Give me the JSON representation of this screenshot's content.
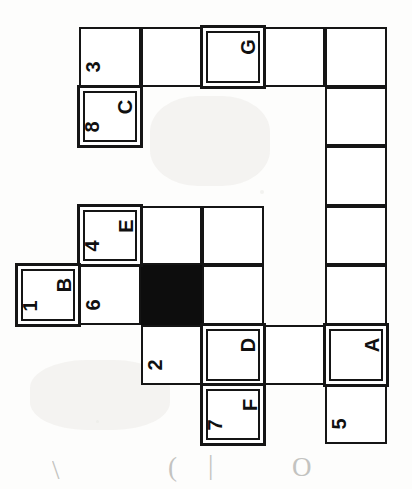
{
  "document": {
    "kind": "hand-drawn grid diagram",
    "orientation_note": "scan rotated 90 degrees; labels read sideways",
    "background_color": "#fdfdfc",
    "line_color": "#151515",
    "filled_cell_color": "#0d0d0d"
  },
  "grid": {
    "columns": 5,
    "rows": 7,
    "left": 79,
    "top": 27,
    "cell_width": 61.6,
    "cell_height": 59.6
  },
  "cells": [
    {
      "id": "c-r0-c0",
      "row": 0,
      "col": 0,
      "number": "3",
      "letter": "",
      "double_border": false,
      "filled": false
    },
    {
      "id": "c-r0-c1",
      "row": 0,
      "col": 1,
      "number": "",
      "letter": "",
      "double_border": false,
      "filled": false
    },
    {
      "id": "c-r0-c2",
      "row": 0,
      "col": 2,
      "number": "",
      "letter": "G",
      "double_border": true,
      "filled": false
    },
    {
      "id": "c-r0-c3",
      "row": 0,
      "col": 3,
      "number": "",
      "letter": "",
      "double_border": false,
      "filled": false
    },
    {
      "id": "c-r0-c4",
      "row": 0,
      "col": 4,
      "number": "",
      "letter": "",
      "double_border": false,
      "filled": false
    },
    {
      "id": "c-r1-c0",
      "row": 1,
      "col": 0,
      "number": "8",
      "letter": "C",
      "double_border": true,
      "filled": false
    },
    {
      "id": "c-r1-c4",
      "row": 1,
      "col": 4,
      "number": "",
      "letter": "",
      "double_border": false,
      "filled": false
    },
    {
      "id": "c-r2-c4",
      "row": 2,
      "col": 4,
      "number": "",
      "letter": "",
      "double_border": false,
      "filled": false
    },
    {
      "id": "c-r3-c0",
      "row": 3,
      "col": 0,
      "number": "4",
      "letter": "E",
      "double_border": true,
      "filled": false
    },
    {
      "id": "c-r3-c1",
      "row": 3,
      "col": 1,
      "number": "",
      "letter": "",
      "double_border": false,
      "filled": false
    },
    {
      "id": "c-r3-c2",
      "row": 3,
      "col": 2,
      "number": "",
      "letter": "",
      "double_border": false,
      "filled": false
    },
    {
      "id": "c-r3-c4",
      "row": 3,
      "col": 4,
      "number": "",
      "letter": "",
      "double_border": false,
      "filled": false
    },
    {
      "id": "c-r4-cL",
      "row": 4,
      "col": -1,
      "number": "1",
      "letter": "B",
      "double_border": true,
      "filled": false
    },
    {
      "id": "c-r4-c0",
      "row": 4,
      "col": 0,
      "number": "6",
      "letter": "",
      "double_border": false,
      "filled": false
    },
    {
      "id": "c-r4-c1",
      "row": 4,
      "col": 1,
      "number": "",
      "letter": "",
      "double_border": false,
      "filled": true
    },
    {
      "id": "c-r4-c2",
      "row": 4,
      "col": 2,
      "number": "",
      "letter": "",
      "double_border": false,
      "filled": false
    },
    {
      "id": "c-r4-c4",
      "row": 4,
      "col": 4,
      "number": "",
      "letter": "",
      "double_border": false,
      "filled": false
    },
    {
      "id": "c-r5-c1",
      "row": 5,
      "col": 1,
      "number": "2",
      "letter": "",
      "double_border": false,
      "filled": false
    },
    {
      "id": "c-r5-c2",
      "row": 5,
      "col": 2,
      "number": "",
      "letter": "D",
      "double_border": true,
      "filled": false
    },
    {
      "id": "c-r5-c3",
      "row": 5,
      "col": 3,
      "number": "",
      "letter": "",
      "double_border": false,
      "filled": false
    },
    {
      "id": "c-r5-c4",
      "row": 5,
      "col": 4,
      "number": "",
      "letter": "A",
      "double_border": true,
      "filled": false
    },
    {
      "id": "c-r6-c2",
      "row": 6,
      "col": 2,
      "number": "7",
      "letter": "F",
      "double_border": true,
      "filled": false
    },
    {
      "id": "c-r6-c4",
      "row": 6,
      "col": 4,
      "number": "5",
      "letter": "",
      "double_border": false,
      "filled": false
    }
  ],
  "annotations": {
    "marginalia": [
      {
        "id": "hw-1",
        "text": "\\",
        "x": 52,
        "y": 455
      },
      {
        "id": "hw-2",
        "text": "(",
        "x": 168,
        "y": 452
      },
      {
        "id": "hw-3",
        "text": "|",
        "x": 208,
        "y": 450
      },
      {
        "id": "hw-4",
        "text": "O",
        "x": 292,
        "y": 452
      }
    ]
  }
}
